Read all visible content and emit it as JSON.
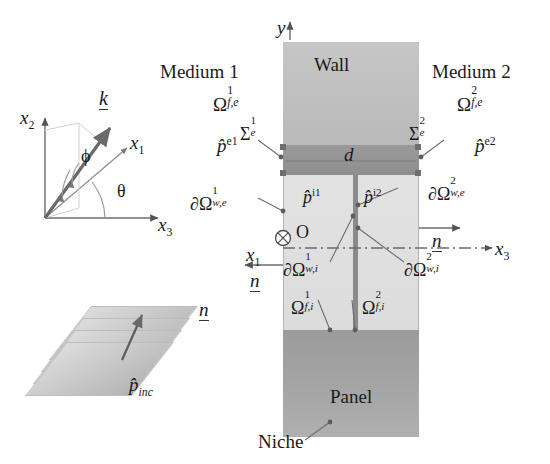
{
  "figure": {
    "type": "schematic-diagram"
  },
  "regions": {
    "wall_label": "Wall",
    "panel_label": "Panel",
    "niche_label": "Niche",
    "thickness_symbol": "d"
  },
  "media": {
    "left": {
      "name": "Medium 1",
      "domain_symbol": "Ω",
      "domain_sup": "1",
      "domain_sub": "f,e",
      "pressure": "p̂",
      "pressure_sup": "e1",
      "surface_symbol": "Σ",
      "surface_sup": "1",
      "surface_sub": "e"
    },
    "right": {
      "name": "Medium 2",
      "domain_symbol": "Ω",
      "domain_sup": "2",
      "domain_sub": "f,e",
      "pressure": "p̂",
      "pressure_sup": "e2",
      "surface_symbol": "Σ",
      "surface_sup": "2",
      "surface_sub": "e"
    }
  },
  "cavities": {
    "left": {
      "domain_symbol": "Ω",
      "domain_sup": "1",
      "domain_sub": "f,i",
      "pressure": "p̂",
      "pressure_sup": "i1",
      "boundary_ext": "∂Ω",
      "boundary_ext_sup": "1",
      "boundary_ext_sub": "w,e",
      "boundary_int": "∂Ω",
      "boundary_int_sup": "1",
      "boundary_int_sub": "w,i"
    },
    "right": {
      "domain_symbol": "Ω",
      "domain_sup": "2",
      "domain_sub": "f,i",
      "pressure": "p̂",
      "pressure_sup": "i2",
      "boundary_ext": "∂Ω",
      "boundary_ext_sup": "2",
      "boundary_ext_sub": "w,e",
      "boundary_int": "∂Ω",
      "boundary_int_sup": "2",
      "boundary_int_sub": "w,i"
    }
  },
  "axes": {
    "global_y": "y",
    "global_x3": "x",
    "global_x3_sub": "3",
    "origin_label": "O",
    "origin_axis": "x",
    "origin_axis_sub": "1"
  },
  "local_frame": {
    "x1": "x",
    "x1_sub": "1",
    "x2": "x",
    "x2_sub": "2",
    "x3": "x",
    "x3_sub": "3",
    "wavevector": "k",
    "angle_phi": "ϕ",
    "angle_theta": "θ"
  },
  "normals": {
    "left_normal": "n",
    "right_normal": "n"
  },
  "incident": {
    "pressure": "p̂",
    "pressure_sub": "inc"
  },
  "colors": {
    "wall_fill": "#c4c4c4",
    "band_fill": "#939393",
    "cavity_fill": "#e0e0e0",
    "panel_fill": "#a2a2a2",
    "divider": "#8a8a8a",
    "ink": "#1a1a1a",
    "leader": "#6e6e6e"
  }
}
